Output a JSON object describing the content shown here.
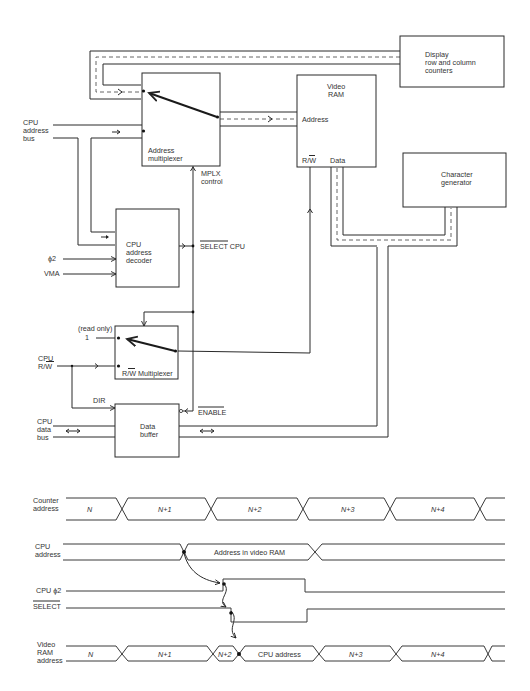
{
  "block_diagram": {
    "blocks": {
      "display_counters": {
        "line1": "Display",
        "line2": "row and column",
        "line3": "counters"
      },
      "video_ram": {
        "line1": "Video",
        "line2": "RAM",
        "address_port": "Address",
        "rw_port": "R/W",
        "data_port": "Data"
      },
      "address_multiplexer": {
        "line1": "Address",
        "line2": "multiplexer"
      },
      "character_generator": {
        "line1": "Character",
        "line2": "generator"
      },
      "cpu_address_decoder": {
        "line1": "CPU",
        "line2": "address",
        "line3": "decoder"
      },
      "rw_multiplexer": {
        "label": "R/W Multiplexer",
        "input_read_only_label": "(read only)",
        "input_read_only_value": "1"
      },
      "data_buffer": {
        "line1": "Data",
        "line2": "buffer"
      }
    },
    "signals": {
      "cpu_address_bus": {
        "line1": "CPU",
        "line2": "address",
        "line3": "bus"
      },
      "mplx_control": {
        "line1": "MPLX",
        "line2": "control"
      },
      "phi2": "ϕ2",
      "vma": "VMA",
      "select_cpu": "SELECT CPU",
      "cpu_rw": {
        "line1": "CPU",
        "line2": "R/W"
      },
      "dir": "DIR",
      "enable": "ENABLE",
      "cpu_data_bus": {
        "line1": "CPU",
        "line2": "data",
        "line3": "bus"
      }
    }
  },
  "timing_diagram": {
    "rows": [
      {
        "label_lines": [
          "Counter",
          "address"
        ],
        "segments": [
          "N",
          "N+1",
          "N+2",
          "N+3",
          "N+4"
        ]
      },
      {
        "label_lines": [
          "CPU",
          "address"
        ],
        "segments": [
          "Address in video RAM"
        ]
      },
      {
        "label_lines": [
          "CPU ϕ2"
        ],
        "segments": []
      },
      {
        "label_lines": [
          "SELECT"
        ],
        "segments": []
      },
      {
        "label_lines": [
          "Video",
          "RAM",
          "address"
        ],
        "segments": [
          "N",
          "N+1",
          "N+2",
          "CPU address",
          "N+3",
          "N+4"
        ]
      }
    ]
  }
}
